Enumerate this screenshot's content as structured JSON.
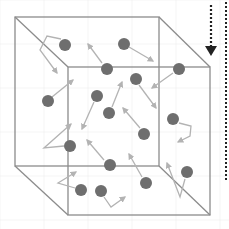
{
  "diagram": {
    "title": "",
    "colors": {
      "background": "#ffffff",
      "grid": "#eeeeee",
      "box_edge": "#8c8c8c",
      "particle": "#6e6e6e",
      "arrow": "#b3b3b3",
      "dotted": "#222222"
    },
    "box": {
      "back": {
        "x1": 15,
        "y1": 17,
        "x2": 159,
        "y2": 166
      },
      "front": {
        "x1": 68,
        "y1": 67,
        "x2": 210,
        "y2": 215
      }
    },
    "particles": [
      {
        "cx": 65,
        "cy": 45,
        "path": [
          [
            61,
            39
          ],
          [
            47,
            36
          ],
          [
            40,
            50
          ],
          [
            57,
            73
          ]
        ]
      },
      {
        "cx": 107,
        "cy": 69,
        "path": [
          [
            102,
            63
          ],
          [
            88,
            44
          ]
        ]
      },
      {
        "cx": 124,
        "cy": 44,
        "path": [
          [
            129,
            47
          ],
          [
            153,
            61
          ]
        ]
      },
      {
        "cx": 179,
        "cy": 69,
        "path": [
          [
            173,
            73
          ],
          [
            152,
            88
          ]
        ]
      },
      {
        "cx": 48,
        "cy": 101,
        "path": [
          [
            52,
            97
          ],
          [
            73,
            80
          ]
        ]
      },
      {
        "cx": 97,
        "cy": 96,
        "path": [
          [
            94,
            102
          ],
          [
            82,
            129
          ]
        ]
      },
      {
        "cx": 136,
        "cy": 79,
        "path": [
          [
            139,
            85
          ],
          [
            156,
            108
          ]
        ]
      },
      {
        "cx": 109,
        "cy": 113,
        "path": [
          [
            112,
            107
          ],
          [
            122,
            82
          ]
        ]
      },
      {
        "cx": 173,
        "cy": 119,
        "path": [
          [
            179,
            123
          ],
          [
            191,
            126
          ],
          [
            190,
            136
          ],
          [
            178,
            142
          ]
        ]
      },
      {
        "cx": 144,
        "cy": 134,
        "path": [
          [
            140,
            128
          ],
          [
            123,
            108
          ]
        ]
      },
      {
        "cx": 70,
        "cy": 146,
        "path": [
          [
            64,
            146
          ],
          [
            44,
            148
          ],
          [
            71,
            124
          ]
        ]
      },
      {
        "cx": 110,
        "cy": 165,
        "path": [
          [
            104,
            160
          ],
          [
            87,
            140
          ]
        ]
      },
      {
        "cx": 146,
        "cy": 183,
        "path": [
          [
            142,
            177
          ],
          [
            129,
            154
          ]
        ]
      },
      {
        "cx": 187,
        "cy": 172,
        "path": [
          [
            185,
            179
          ],
          [
            180,
            197
          ],
          [
            167,
            163
          ]
        ]
      },
      {
        "cx": 81,
        "cy": 190,
        "path": [
          [
            75,
            188
          ],
          [
            58,
            183
          ],
          [
            76,
            172
          ]
        ]
      },
      {
        "cx": 101,
        "cy": 191,
        "path": [
          [
            104,
            197
          ],
          [
            111,
            207
          ],
          [
            125,
            197
          ]
        ]
      }
    ],
    "particle_radius": 6,
    "dotted_arrow": {
      "x": 211,
      "y1": 5,
      "y2": 56,
      "head_w": 12,
      "head_h": 10
    },
    "dotted_line": {
      "x": 226,
      "y1": 2,
      "y2": 182
    }
  }
}
